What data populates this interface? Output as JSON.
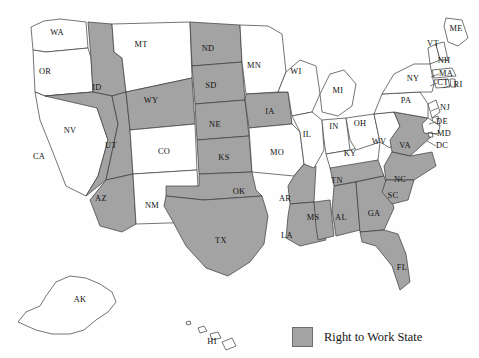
{
  "map": {
    "title": "",
    "projection_note": "United States choropleth with Alaska and Hawaii insets",
    "colors": {
      "right_to_work_fill": "#a3a3a3",
      "non_right_to_work_fill": "#ffffff",
      "state_border": "#3a3a3a",
      "label_text": "#111111"
    }
  },
  "legend": {
    "label": "Right to Work State",
    "swatch_color": "#a3a3a3",
    "swatch_border": "#6d6d6d"
  },
  "chart_data": {
    "type": "map",
    "value_field": "right_to_work",
    "categories": [
      "Right to Work State",
      "Not Right to Work"
    ],
    "counts": {
      "right_to_work": 22,
      "not_right_to_work": 29
    },
    "states": [
      {
        "code": "WA",
        "label": "WA",
        "right_to_work": false,
        "x": 57,
        "y": 33
      },
      {
        "code": "OR",
        "label": "OR",
        "right_to_work": false,
        "x": 45,
        "y": 72
      },
      {
        "code": "CA",
        "label": "CA",
        "right_to_work": false,
        "x": 39,
        "y": 157
      },
      {
        "code": "ID",
        "label": "ID",
        "right_to_work": true,
        "x": 97,
        "y": 88
      },
      {
        "code": "NV",
        "label": "NV",
        "right_to_work": true,
        "x": 70,
        "y": 131
      },
      {
        "code": "UT",
        "label": "UT",
        "right_to_work": true,
        "x": 111,
        "y": 146
      },
      {
        "code": "AZ",
        "label": "AZ",
        "right_to_work": true,
        "x": 101,
        "y": 199
      },
      {
        "code": "MT",
        "label": "MT",
        "right_to_work": false,
        "x": 141,
        "y": 45
      },
      {
        "code": "WY",
        "label": "WY",
        "right_to_work": true,
        "x": 151,
        "y": 101
      },
      {
        "code": "CO",
        "label": "CO",
        "right_to_work": false,
        "x": 164,
        "y": 152
      },
      {
        "code": "NM",
        "label": "NM",
        "right_to_work": false,
        "x": 152,
        "y": 206
      },
      {
        "code": "ND",
        "label": "ND",
        "right_to_work": true,
        "x": 208,
        "y": 49
      },
      {
        "code": "SD",
        "label": "SD",
        "right_to_work": true,
        "x": 211,
        "y": 86
      },
      {
        "code": "NE",
        "label": "NE",
        "right_to_work": true,
        "x": 215,
        "y": 125
      },
      {
        "code": "KS",
        "label": "KS",
        "right_to_work": true,
        "x": 224,
        "y": 158
      },
      {
        "code": "OK",
        "label": "OK",
        "right_to_work": true,
        "x": 239,
        "y": 192
      },
      {
        "code": "TX",
        "label": "TX",
        "right_to_work": true,
        "x": 221,
        "y": 241
      },
      {
        "code": "MN",
        "label": "MN",
        "right_to_work": false,
        "x": 254,
        "y": 66
      },
      {
        "code": "IA",
        "label": "IA",
        "right_to_work": true,
        "x": 270,
        "y": 112
      },
      {
        "code": "MO",
        "label": "MO",
        "right_to_work": false,
        "x": 277,
        "y": 153
      },
      {
        "code": "AR",
        "label": "AR",
        "right_to_work": true,
        "x": 285,
        "y": 199
      },
      {
        "code": "LA",
        "label": "LA",
        "right_to_work": true,
        "x": 287,
        "y": 236
      },
      {
        "code": "WI",
        "label": "WI",
        "right_to_work": false,
        "x": 296,
        "y": 72
      },
      {
        "code": "IL",
        "label": "IL",
        "right_to_work": false,
        "x": 307,
        "y": 135
      },
      {
        "code": "MS",
        "label": "MS",
        "right_to_work": true,
        "x": 313,
        "y": 218
      },
      {
        "code": "MI",
        "label": "MI",
        "right_to_work": false,
        "x": 338,
        "y": 91
      },
      {
        "code": "IN",
        "label": "IN",
        "right_to_work": false,
        "x": 334,
        "y": 127
      },
      {
        "code": "KY",
        "label": "KY",
        "right_to_work": false,
        "x": 350,
        "y": 154
      },
      {
        "code": "TN",
        "label": "TN",
        "right_to_work": true,
        "x": 337,
        "y": 181
      },
      {
        "code": "AL",
        "label": "AL",
        "right_to_work": true,
        "x": 341,
        "y": 218
      },
      {
        "code": "GA",
        "label": "GA",
        "right_to_work": true,
        "x": 374,
        "y": 214
      },
      {
        "code": "FL",
        "label": "FL",
        "right_to_work": true,
        "x": 402,
        "y": 268
      },
      {
        "code": "OH",
        "label": "OH",
        "right_to_work": false,
        "x": 360,
        "y": 124
      },
      {
        "code": "WV",
        "label": "WV",
        "right_to_work": false,
        "x": 379,
        "y": 142
      },
      {
        "code": "VA",
        "label": "VA",
        "right_to_work": true,
        "x": 405,
        "y": 146
      },
      {
        "code": "NC",
        "label": "NC",
        "right_to_work": true,
        "x": 400,
        "y": 180
      },
      {
        "code": "SC",
        "label": "SC",
        "right_to_work": true,
        "x": 393,
        "y": 196
      },
      {
        "code": "PA",
        "label": "PA",
        "right_to_work": false,
        "x": 406,
        "y": 101
      },
      {
        "code": "NY",
        "label": "NY",
        "right_to_work": false,
        "x": 413,
        "y": 79
      },
      {
        "code": "ME",
        "label": "ME",
        "right_to_work": false,
        "x": 456,
        "y": 29
      },
      {
        "code": "VT",
        "label": "VT",
        "right_to_work": false,
        "x": 433,
        "y": 44
      },
      {
        "code": "NH",
        "label": "NH",
        "right_to_work": false,
        "x": 444,
        "y": 61
      },
      {
        "code": "MA",
        "label": "MA",
        "right_to_work": false,
        "x": 446,
        "y": 74
      },
      {
        "code": "CT",
        "label": "CT",
        "right_to_work": false,
        "x": 443,
        "y": 83
      },
      {
        "code": "RI",
        "label": "RI",
        "right_to_work": false,
        "x": 458,
        "y": 85
      },
      {
        "code": "NJ",
        "label": "NJ",
        "right_to_work": false,
        "x": 445,
        "y": 108
      },
      {
        "code": "DE",
        "label": "DE",
        "right_to_work": false,
        "x": 442,
        "y": 122
      },
      {
        "code": "MD",
        "label": "MD",
        "right_to_work": false,
        "x": 444,
        "y": 134
      },
      {
        "code": "DC",
        "label": "DC",
        "right_to_work": false,
        "x": 442,
        "y": 146
      },
      {
        "code": "AK",
        "label": "AK",
        "right_to_work": false,
        "x": 80,
        "y": 300
      },
      {
        "code": "HI",
        "label": "HI",
        "right_to_work": false,
        "x": 212,
        "y": 342
      }
    ]
  }
}
